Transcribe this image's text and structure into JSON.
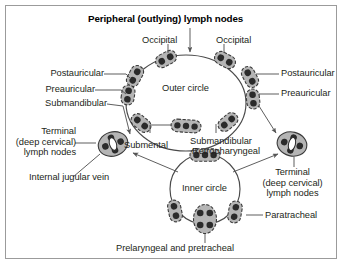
{
  "figure": {
    "title": "Peripheral (outlying) lymph nodes",
    "border_color": "#9b9b9b",
    "background": "#ffffff",
    "node_fill": "#b5b5b5",
    "node_stroke": "#3a3a3a",
    "dot_color": "#2b2b2b",
    "vein_fill": "#ffffff",
    "line_color": "#555555"
  },
  "labels": {
    "occipital_left": "Occipital",
    "occipital_right": "Occipital",
    "postauricular_left": "Postauricular",
    "postauricular_right": "Postauricular",
    "preauricular_left": "Preauricular",
    "preauricular_right": "Preauricular",
    "submandibular_left": "Submandibular",
    "outer_circle": "Outer circle",
    "inner_circle": "Inner circle",
    "submental": "Submental",
    "submandibular_center": "Submandibular",
    "retropharyngeal": "Retropharyngeal",
    "terminal_left_line1": "Terminal",
    "terminal_left_line2": "(deep cervical)",
    "terminal_left_line3": "lymph nodes",
    "terminal_right_line1": "Terminal",
    "terminal_right_line2": "(deep cervical)",
    "terminal_right_line3": "lymph nodes",
    "internal_jugular_vein": "Internal jugular vein",
    "paratracheal": "Paratracheal",
    "prelaryngeal_pretracheal": "Prelaryngeal and pretracheal"
  },
  "diagram": {
    "type": "anatomical-schematic",
    "outer_circle_nodes": [
      {
        "name": "occipital-left",
        "dots": 2
      },
      {
        "name": "occipital-right",
        "dots": 2
      },
      {
        "name": "postauricular-left",
        "dots": 2
      },
      {
        "name": "postauricular-right",
        "dots": 2
      },
      {
        "name": "preauricular-left",
        "dots": 2
      },
      {
        "name": "preauricular-right",
        "dots": 2
      },
      {
        "name": "submandibular-left",
        "dots": 2
      },
      {
        "name": "submandibular-right",
        "dots": 2
      },
      {
        "name": "submental-center",
        "dots": 3
      }
    ],
    "inner_circle_nodes": [
      {
        "name": "retropharyngeal",
        "dots": 3
      },
      {
        "name": "paratracheal-left",
        "dots": 2
      },
      {
        "name": "paratracheal-right",
        "dots": 2
      },
      {
        "name": "prelaryngeal-pretracheal",
        "dots": 4
      }
    ],
    "terminal_nodes": [
      {
        "name": "terminal-left",
        "dots": 4,
        "vein": true
      },
      {
        "name": "terminal-right",
        "dots": 4,
        "vein": true
      }
    ]
  }
}
